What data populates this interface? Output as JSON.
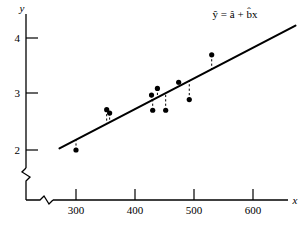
{
  "chart_data": {
    "type": "scatter",
    "title": "",
    "subtitle": "",
    "xlabel": "x",
    "ylabel": "y",
    "xlim": [
      255,
      680
    ],
    "ylim": [
      1.62,
      4.35
    ],
    "grid": false,
    "legend_position": "none",
    "x_ticks": [
      300,
      400,
      500,
      600
    ],
    "x_tick_labels": [
      "300",
      "400",
      "500",
      "600"
    ],
    "y_ticks": [
      2,
      3,
      4
    ],
    "y_tick_labels": [
      "2",
      "3",
      "4"
    ],
    "axis_breaks": {
      "x": true,
      "y": true
    },
    "annotations": [
      {
        "name": "regression-equation",
        "text": "ŷ = â + b̂x",
        "x": 560,
        "y": 4.25
      }
    ],
    "series": [
      {
        "name": "observations",
        "marker": "filled-circle",
        "color": "#000000",
        "points": [
          {
            "x": 300,
            "y": 2.0
          },
          {
            "x": 352,
            "y": 2.72
          },
          {
            "x": 357,
            "y": 2.66
          },
          {
            "x": 428,
            "y": 2.98
          },
          {
            "x": 430,
            "y": 2.71
          },
          {
            "x": 438,
            "y": 3.1
          },
          {
            "x": 452,
            "y": 2.71
          },
          {
            "x": 474,
            "y": 3.21
          },
          {
            "x": 492,
            "y": 2.9
          },
          {
            "x": 530,
            "y": 3.7
          }
        ]
      }
    ],
    "fit_line": {
      "name": "least-squares-line",
      "style": "solid",
      "color": "#000000",
      "x_start": 272,
      "y_start": 2.03,
      "x_end": 672,
      "y_end": 4.22,
      "slope": 0.005475,
      "intercept": 0.541
    },
    "residual_lines": {
      "style": "dashed",
      "color": "#000000",
      "description": "vertical dashed segments from each point to the fitted line"
    }
  },
  "axis": {
    "x_name": "x",
    "y_name": "y"
  },
  "equation": {
    "text": "ŷ = â + b̂x"
  }
}
